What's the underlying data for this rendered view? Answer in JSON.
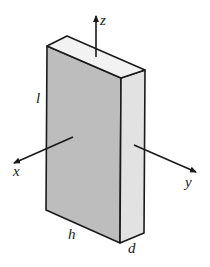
{
  "diagram": {
    "type": "3d-rectangular-slab-with-axes",
    "axes": {
      "x": "x",
      "y": "y",
      "z": "z"
    },
    "dimensions": {
      "length": "l",
      "height": "h",
      "depth": "d"
    },
    "colors": {
      "front_face": "#bdbdbd",
      "side_face": "#e2e2e2",
      "top_face": "#f2f2f2",
      "edge": "#1a1a1a"
    }
  }
}
